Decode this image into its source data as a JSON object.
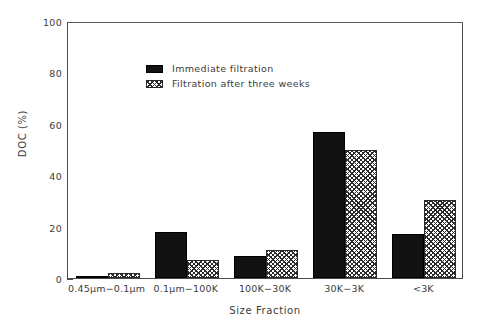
{
  "chart_data": {
    "type": "bar",
    "title": "",
    "xlabel": "Size Fraction",
    "ylabel": "DOC (%)",
    "ylim": [
      0,
      100
    ],
    "ytick_labels": [
      "0",
      "20",
      "40",
      "60",
      "80",
      "100"
    ],
    "ytick_values": [
      0,
      20,
      40,
      60,
      80,
      100
    ],
    "yminor_values": [
      10,
      30,
      50,
      70,
      90
    ],
    "grid": false,
    "legend_position": "upper-left-inside",
    "categories": [
      "0.45μm−0.1μm",
      "0.1μm−100K",
      "100K−30K",
      "30K−3K",
      "<3K"
    ],
    "series": [
      {
        "name": "Immediate filtration",
        "pattern": "solid",
        "color": "#121212",
        "values": [
          0.5,
          18,
          8.5,
          57,
          17
        ]
      },
      {
        "name": "Filtration after three weeks",
        "pattern": "cross-hatch",
        "color": "#ffffff",
        "values": [
          2,
          7,
          11,
          50,
          30.5
        ]
      }
    ]
  },
  "legend": {
    "items": [
      {
        "label": "Immediate filtration",
        "swatch": "solid-black-swatch"
      },
      {
        "label": "Filtration after three weeks",
        "swatch": "cross-hatch-swatch"
      }
    ]
  }
}
